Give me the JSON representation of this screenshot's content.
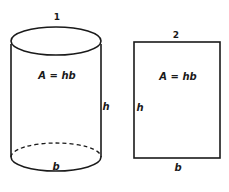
{
  "figure": {
    "stroke_color": "#1a1a1a",
    "background": "#ffffff",
    "shapes": [
      {
        "id": "cylinder",
        "number_label": "1",
        "area_formula": "A = hb",
        "height_label": "h",
        "base_label": "b"
      },
      {
        "id": "rectangle",
        "number_label": "2",
        "area_formula": "A = hb",
        "height_label": "h",
        "base_label": "b"
      }
    ]
  }
}
